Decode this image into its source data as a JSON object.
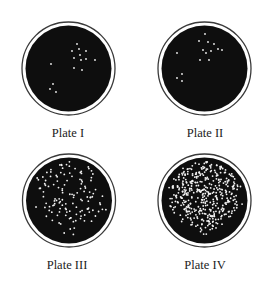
{
  "figure": {
    "colors": {
      "background": "#ffffff",
      "agar": "#0e0e0e",
      "ring": "#3a3a3a",
      "colony": "#f2f2f2",
      "label": "#222222"
    },
    "plates": [
      {
        "id": "plate-1",
        "label": "Plate I",
        "cx": 68.5,
        "cy": 68.5,
        "colony_count_visible": 15,
        "colonies": [
          [
            77,
            44
          ],
          [
            72,
            51
          ],
          [
            79,
            49
          ],
          [
            86,
            51
          ],
          [
            80,
            55
          ],
          [
            74,
            58
          ],
          [
            81,
            60
          ],
          [
            86,
            59
          ],
          [
            95,
            60
          ],
          [
            74,
            68
          ],
          [
            82,
            70
          ],
          [
            51,
            64
          ],
          [
            53,
            84
          ],
          [
            50,
            89
          ],
          [
            56,
            92
          ]
        ]
      },
      {
        "id": "plate-2",
        "label": "Plate II",
        "cx": 204.5,
        "cy": 68.5,
        "colony_count_visible": 15,
        "colonies": [
          [
            205,
            34
          ],
          [
            199,
            41
          ],
          [
            208,
            42
          ],
          [
            214,
            44
          ],
          [
            203,
            50
          ],
          [
            206,
            53
          ],
          [
            211,
            51
          ],
          [
            218,
            49
          ],
          [
            222,
            50
          ],
          [
            200,
            60
          ],
          [
            209,
            60
          ],
          [
            177,
            53
          ],
          [
            182,
            74
          ],
          [
            177,
            78
          ],
          [
            182,
            81
          ]
        ]
      },
      {
        "id": "plate-3",
        "label": "Plate III",
        "cx": 69,
        "cy": 200.5,
        "colony_count_visible": 130,
        "density": "moderate",
        "seed": 7
      },
      {
        "id": "plate-4",
        "label": "Plate IV",
        "cx": 204.5,
        "cy": 200.5,
        "colony_count_visible": 420,
        "density": "high",
        "seed": 13
      }
    ],
    "geometry": {
      "agar_radius": 43,
      "ring_radius": 46.5,
      "ring_width": 1.3
    }
  }
}
